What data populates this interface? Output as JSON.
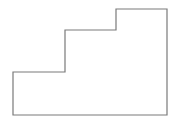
{
  "diagram": {
    "shape": "stair-step polygon outline",
    "stroke_color": "#7a7a7a",
    "fill_color": "#ffffff",
    "stroke_width": 1.2,
    "points": [
      [
        13,
        115
      ],
      [
        13,
        72
      ],
      [
        65,
        72
      ],
      [
        65,
        30
      ],
      [
        116,
        30
      ],
      [
        116,
        9
      ],
      [
        167,
        9
      ],
      [
        167,
        115
      ]
    ]
  }
}
